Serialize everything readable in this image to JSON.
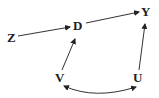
{
  "diagram": {
    "type": "causal-dag",
    "nodes": [
      {
        "id": "Z",
        "label": "Z",
        "x": 12,
        "y": 42
      },
      {
        "id": "D",
        "label": "D",
        "x": 78,
        "y": 30
      },
      {
        "id": "Y",
        "label": "Y",
        "x": 146,
        "y": 16
      },
      {
        "id": "V",
        "label": "V",
        "x": 60,
        "y": 82
      },
      {
        "id": "U",
        "label": "U",
        "x": 138,
        "y": 82
      }
    ],
    "edges": [
      {
        "from": "Z",
        "to": "D",
        "type": "directed"
      },
      {
        "from": "D",
        "to": "Y",
        "type": "directed"
      },
      {
        "from": "V",
        "to": "D",
        "type": "directed"
      },
      {
        "from": "U",
        "to": "Y",
        "type": "directed"
      },
      {
        "from": "V",
        "to": "U",
        "type": "bidirected",
        "curved": true
      }
    ]
  }
}
